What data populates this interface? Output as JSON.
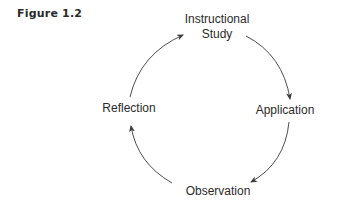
{
  "figure": {
    "label": "Figure 1.2"
  },
  "diagram": {
    "type": "cycle",
    "nodes": [
      {
        "id": "instructional-study",
        "line1": "Instructional",
        "line2": "Study"
      },
      {
        "id": "application",
        "label": "Application"
      },
      {
        "id": "observation",
        "label": "Observation"
      },
      {
        "id": "reflection",
        "label": "Reflection"
      }
    ],
    "edges": [
      {
        "from": "instructional-study",
        "to": "application"
      },
      {
        "from": "application",
        "to": "observation"
      },
      {
        "from": "observation",
        "to": "reflection"
      },
      {
        "from": "reflection",
        "to": "instructional-study"
      }
    ],
    "colors": {
      "text": "#2b2b2b",
      "arrow": "#3a3a3a",
      "background": "#ffffff"
    }
  }
}
